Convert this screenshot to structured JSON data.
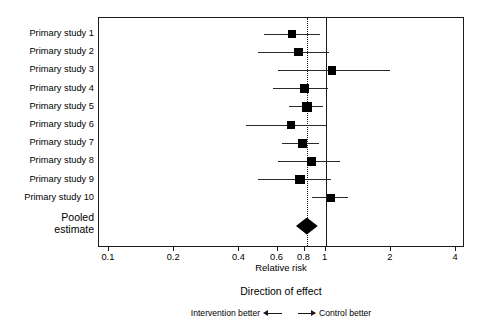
{
  "chart_data": {
    "type": "forest",
    "title": "",
    "xlabel": "Relative risk",
    "ylabel": "",
    "xscale": "log",
    "xlim": [
      0.09,
      4.4
    ],
    "ticks": [
      {
        "value": 0.1,
        "label": "0.1"
      },
      {
        "value": 0.2,
        "label": "0.2"
      },
      {
        "value": 0.4,
        "label": "0.4"
      },
      {
        "value": 0.6,
        "label": "0.6"
      },
      {
        "value": 0.8,
        "label": "0.8"
      },
      {
        "value": 1,
        "label": "1"
      },
      {
        "value": 2,
        "label": "2"
      },
      {
        "value": 4,
        "label": "4"
      }
    ],
    "null_value": 1,
    "pooled_reference_line": 0.82,
    "grid": false,
    "legend_position": "below-axis",
    "studies": [
      {
        "label": "Primary study 1",
        "estimate": 0.7,
        "ci_low": 0.52,
        "ci_high": 0.94,
        "weight": 7
      },
      {
        "label": "Primary study 2",
        "estimate": 0.75,
        "ci_low": 0.49,
        "ci_high": 1.04,
        "weight": 8
      },
      {
        "label": "Primary study 3",
        "estimate": 1.07,
        "ci_low": 0.6,
        "ci_high": 1.98,
        "weight": 7
      },
      {
        "label": "Primary study 4",
        "estimate": 0.8,
        "ci_low": 0.57,
        "ci_high": 1.03,
        "weight": 8
      },
      {
        "label": "Primary study 5",
        "estimate": 0.82,
        "ci_low": 0.68,
        "ci_high": 0.97,
        "weight": 17
      },
      {
        "label": "Primary study 6",
        "estimate": 0.69,
        "ci_low": 0.43,
        "ci_high": 1.02,
        "weight": 6
      },
      {
        "label": "Primary study 7",
        "estimate": 0.78,
        "ci_low": 0.63,
        "ci_high": 0.93,
        "weight": 9
      },
      {
        "label": "Primary study 8",
        "estimate": 0.86,
        "ci_low": 0.6,
        "ci_high": 1.16,
        "weight": 7
      },
      {
        "label": "Primary study 9",
        "estimate": 0.76,
        "ci_low": 0.49,
        "ci_high": 1.06,
        "weight": 12
      },
      {
        "label": "Primary study 10",
        "estimate": 1.06,
        "ci_low": 0.87,
        "ci_high": 1.27,
        "weight": 8
      }
    ],
    "pooled": {
      "label_line1": "Pooled",
      "label_line2": "estimate",
      "estimate": 0.82,
      "ci_low": 0.73,
      "ci_high": 0.92
    },
    "annotations": {
      "direction_title": "Direction of effect",
      "left_direction": "Intervention better",
      "right_direction": "Control better",
      "left_arrow_icon": "arrow-left-icon",
      "right_arrow_icon": "arrow-right-icon"
    },
    "colors": {
      "marker": "#000000",
      "ci_line": "#2a2a2a",
      "axis": "#1a1a1a",
      "background": "#ffffff"
    }
  }
}
